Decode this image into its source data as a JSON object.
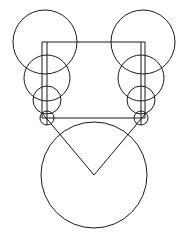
{
  "figure": {
    "title": "geometric-line-drawing",
    "canvas": {
      "width": 189,
      "height": 242,
      "background": "#ffffff"
    },
    "stroke": {
      "color": "#1a1a1a",
      "width": 1,
      "fill": "none"
    },
    "circles": [
      {
        "name": "top-left-large-circle",
        "cx": 45,
        "cy": 42,
        "r": 32
      },
      {
        "name": "left-second-circle",
        "cx": 47,
        "cy": 78,
        "r": 23
      },
      {
        "name": "left-third-circle",
        "cx": 47,
        "cy": 100,
        "r": 14
      },
      {
        "name": "left-smallest-circle",
        "cx": 47,
        "cy": 118,
        "r": 7
      },
      {
        "name": "top-right-large-circle",
        "cx": 143,
        "cy": 42,
        "r": 32
      },
      {
        "name": "right-second-circle",
        "cx": 141,
        "cy": 78,
        "r": 23
      },
      {
        "name": "right-third-circle",
        "cx": 141,
        "cy": 100,
        "r": 14
      },
      {
        "name": "right-smallest-circle",
        "cx": 141,
        "cy": 118,
        "r": 7
      },
      {
        "name": "bottom-large-circle",
        "cx": 94,
        "cy": 175,
        "r": 53
      }
    ],
    "square": {
      "name": "connecting-square",
      "x": 42,
      "y": 42,
      "width": 103,
      "height": 76,
      "note": "open rectangle whose top edge links the two circle chains"
    },
    "lines": [
      {
        "name": "left-vertical-axis",
        "x1": 47,
        "y1": 42,
        "x2": 47,
        "y2": 125
      },
      {
        "name": "right-vertical-axis",
        "x1": 141,
        "y1": 42,
        "x2": 141,
        "y2": 125
      },
      {
        "name": "v-left-diagonal",
        "x1": 42,
        "y1": 113,
        "x2": 94,
        "y2": 175
      },
      {
        "name": "v-right-diagonal",
        "x1": 146,
        "y1": 113,
        "x2": 94,
        "y2": 175
      }
    ],
    "vertex": {
      "name": "v-apex-point",
      "x": 94,
      "y": 175
    }
  }
}
